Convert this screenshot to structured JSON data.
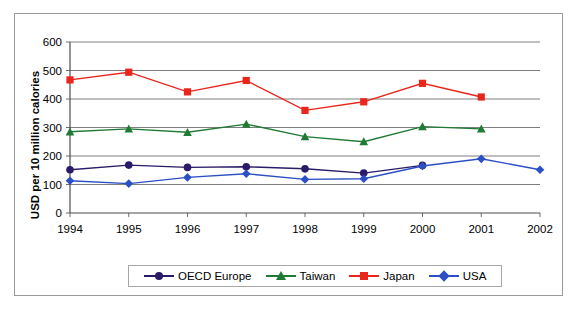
{
  "chart_data": {
    "type": "line",
    "title": "",
    "xlabel": "",
    "ylabel": "USD per 10 million calories",
    "x": [
      "1994",
      "1995",
      "1996",
      "1997",
      "1998",
      "1999",
      "2000",
      "2001",
      "2002"
    ],
    "categories": [
      "1994",
      "1995",
      "1996",
      "1997",
      "1998",
      "1999",
      "2000",
      "2001",
      "2002"
    ],
    "ylim": [
      0,
      600
    ],
    "yticks": [
      "0",
      "100",
      "200",
      "300",
      "400",
      "500",
      "600"
    ],
    "grid": "horizontal",
    "legend_position": "bottom",
    "series": [
      {
        "name": "OECD Europe",
        "color": "#2b1a68",
        "marker": "circle",
        "values": [
          152,
          168,
          160,
          162,
          155,
          140,
          167,
          null,
          null
        ]
      },
      {
        "name": "Taiwan",
        "color": "#1f7a34",
        "marker": "triangle",
        "values": [
          285,
          295,
          283,
          312,
          268,
          250,
          303,
          295,
          null
        ]
      },
      {
        "name": "Japan",
        "color": "#e8261c",
        "marker": "square",
        "values": [
          467,
          494,
          425,
          465,
          360,
          390,
          455,
          407,
          null
        ]
      },
      {
        "name": "USA",
        "color": "#2b4fc4",
        "marker": "diamond",
        "values": [
          113,
          103,
          125,
          138,
          118,
          120,
          165,
          190,
          152
        ]
      }
    ]
  },
  "legend": {
    "items": [
      {
        "label": "OECD Europe"
      },
      {
        "label": "Taiwan"
      },
      {
        "label": "Japan"
      },
      {
        "label": "USA"
      }
    ]
  }
}
